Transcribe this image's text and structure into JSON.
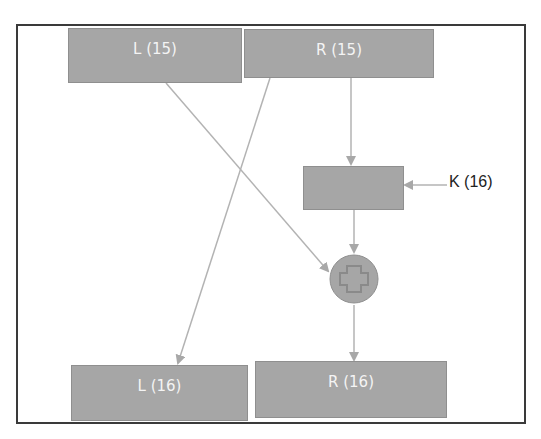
{
  "diagram": {
    "type": "feistel-round",
    "nodes": {
      "l15": {
        "label": "L (15)"
      },
      "r15": {
        "label": "R (15)"
      },
      "f_box": {
        "label": ""
      },
      "key": {
        "label": "K (16)"
      },
      "xor": {
        "symbol": "plus-circle"
      },
      "l16": {
        "label": "L (16)"
      },
      "r16": {
        "label": "R (16)"
      }
    },
    "edges": [
      {
        "from": "r15",
        "to": "f_box"
      },
      {
        "from": "key",
        "to": "f_box"
      },
      {
        "from": "f_box",
        "to": "xor"
      },
      {
        "from": "l15",
        "to": "xor"
      },
      {
        "from": "r15",
        "to": "l16"
      },
      {
        "from": "xor",
        "to": "r16"
      }
    ],
    "colors": {
      "box_fill": "#a6a6a6",
      "box_text": "#f4f4f4",
      "line": "#b3b3b3",
      "frame": "#3a3a3a"
    }
  }
}
